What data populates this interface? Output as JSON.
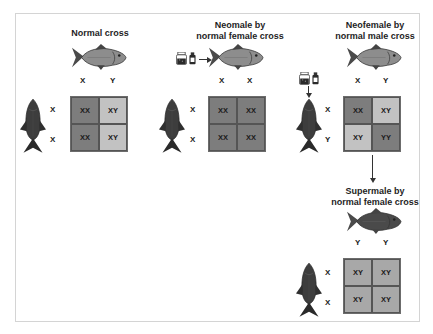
{
  "diagram": {
    "colors": {
      "dark_cell": "#7d7d7d",
      "light_cell": "#c2c2c2",
      "mid_cell": "#8e8e8e",
      "fish_light": "#8d8d8d",
      "fish_dark": "#3a3a3a",
      "frame_border": "#d4d4d4"
    },
    "panels": [
      {
        "id": "normal",
        "title_lines": [
          "Normal cross"
        ],
        "male_fish": "gray-fish-icon",
        "male_alleles": [
          "X",
          "Y"
        ],
        "female_fish": "dark-vertical-fish-icon",
        "female_alleles": [
          "X",
          "X"
        ],
        "grid": [
          [
            "XX",
            "XY"
          ],
          [
            "XX",
            "XY"
          ]
        ],
        "grid_shade": [
          [
            "dark",
            "light"
          ],
          [
            "dark",
            "light"
          ]
        ]
      },
      {
        "id": "neomale",
        "title_lines": [
          "Neomale by",
          "normal female cross"
        ],
        "treatment_icons": [
          "hormone-jar-icon",
          "hormone-bottle-icon"
        ],
        "male_fish": "gray-fish-icon",
        "male_alleles": [
          "X",
          "X"
        ],
        "female_fish": "dark-vertical-fish-icon",
        "female_alleles": [
          "X",
          "X"
        ],
        "grid": [
          [
            "XX",
            "XX"
          ],
          [
            "XX",
            "XX"
          ]
        ],
        "grid_shade": [
          [
            "dark",
            "dark"
          ],
          [
            "dark",
            "dark"
          ]
        ]
      },
      {
        "id": "neofemale",
        "title_lines": [
          "Neofemale by",
          "normal male cross"
        ],
        "treatment_icons": [
          "hormone-jar-icon",
          "hormone-bottle-icon"
        ],
        "male_fish": "gray-fish-icon",
        "male_alleles": [
          "X",
          "Y"
        ],
        "female_fish": "dark-vertical-fish-icon",
        "female_alleles": [
          "X",
          "Y"
        ],
        "grid": [
          [
            "XX",
            "XY"
          ],
          [
            "XY",
            "YY"
          ]
        ],
        "grid_shade": [
          [
            "dark",
            "light"
          ],
          [
            "light",
            "dark"
          ]
        ]
      },
      {
        "id": "supermale",
        "title_lines": [
          "Supermale by",
          "normal female cross"
        ],
        "male_fish": "dark-fish-icon",
        "male_alleles": [
          "Y",
          "Y"
        ],
        "female_fish": "dark-vertical-fish-icon",
        "female_alleles": [
          "X",
          "X"
        ],
        "grid": [
          [
            "XY",
            "XY"
          ],
          [
            "XY",
            "XY"
          ]
        ],
        "grid_shade": [
          [
            "mid",
            "mid"
          ],
          [
            "mid",
            "mid"
          ]
        ]
      }
    ]
  }
}
